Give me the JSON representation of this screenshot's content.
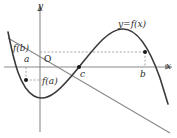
{
  "figure": {
    "kind": "cartesian-function-graph",
    "axis_color": "#8a8a8a",
    "curve_color": "#3a3a3a",
    "secant_color": "#8a8a8a",
    "dashed_color": "#9a9a9a",
    "point_color": "#1a1a1a",
    "background": "#ffffff",
    "labels": {
      "y_axis": "y",
      "x_axis": "x",
      "origin": "O",
      "a": "a",
      "b": "b",
      "c": "c",
      "f_a": "f(a)",
      "f_b": "f(b)",
      "function": "y=f(x)"
    }
  },
  "chart_data": {
    "type": "line",
    "title": "",
    "xlabel": "x",
    "ylabel": "y",
    "grid": false,
    "legend": "none",
    "annotations": [
      {
        "name": "function-label",
        "text": "y=f(x)",
        "x": 118,
        "y": 20
      },
      {
        "name": "origin-label",
        "text": "O",
        "x": 44,
        "y": 55
      },
      {
        "name": "a-tick-label",
        "text": "a",
        "x": 24,
        "y": 55
      },
      {
        "name": "b-tick-label",
        "text": "b",
        "x": 140,
        "y": 70
      },
      {
        "name": "c-tick-label",
        "text": "c",
        "x": 80,
        "y": 70
      },
      {
        "name": "f-a-label",
        "text": "f(a)",
        "x": 42,
        "y": 77
      },
      {
        "name": "f-b-label",
        "text": "f(b)",
        "x": 13,
        "y": 44
      }
    ],
    "marked_points": [
      {
        "name": "point-a",
        "label": "(a, f(a))",
        "px": 26,
        "py": 80
      },
      {
        "name": "point-c",
        "label": "(c, 0)",
        "px": 79,
        "py": 67
      },
      {
        "name": "point-b",
        "label": "(b, f(b))",
        "px": 145,
        "py": 52
      }
    ],
    "axis_pixels": {
      "x_axis_y": 67,
      "y_axis_x": 40
    },
    "curve_path": "M 8,32 C 14,62 20,88 34,96 C 48,104 62,88 79,67 C 96,46 108,30 122,29 C 136,28 148,44 160,78 L 168,104",
    "secant_path": "M 8,38 L 170,133",
    "dashed_segments": [
      {
        "name": "f-b-horizontal-dash",
        "x1": 40,
        "y1": 52,
        "x2": 145,
        "y2": 52
      },
      {
        "name": "b-vertical-dash",
        "x1": 145,
        "y1": 52,
        "x2": 145,
        "y2": 67
      },
      {
        "name": "a-vertical-dash",
        "x1": 26,
        "y1": 67,
        "x2": 26,
        "y2": 80
      },
      {
        "name": "f-a-horizontal-dash",
        "x1": 26,
        "y1": 80,
        "x2": 42,
        "y2": 80
      }
    ]
  }
}
